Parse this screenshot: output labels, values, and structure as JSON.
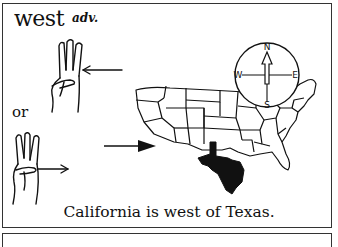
{
  "entry": {
    "headword": "west",
    "part_of_speech": "adv.",
    "alternative_label": "or",
    "example_sentence": "California is west of Texas."
  },
  "illustration": {
    "sign_variants": [
      {
        "name": "three-finger-hand-sign-arrow-left",
        "arrow": "points toward palm from right"
      },
      {
        "name": "three-finger-hand-sign-arrow-right",
        "arrow": "points right away from hand"
      }
    ],
    "map": {
      "subject": "continental United States",
      "highlighted_state": "Texas",
      "highlight_color": "#111111",
      "arrow_target": "California (west coast)"
    },
    "compass": {
      "north": "N",
      "south": "S",
      "east": "E",
      "west": "W"
    }
  },
  "colors": {
    "ink": "#111111",
    "paper": "#ffffff",
    "border": "#333333"
  }
}
